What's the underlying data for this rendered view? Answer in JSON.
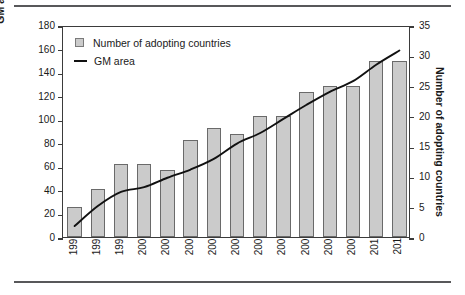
{
  "figure": {
    "has_top_rule": true,
    "has_bottom_rule": true,
    "frame_color": "#3b3b3b",
    "bar_fill": "#cbcbcb",
    "bar_stroke": "#6a6a6a",
    "line_color": "#111111"
  },
  "legend": {
    "position": "top-left-inside",
    "items": [
      {
        "marker": "square-swatch-icon",
        "label": "Number of adopting countries"
      },
      {
        "marker": "line-swatch-icon",
        "label": "GM area"
      }
    ]
  },
  "axes": {
    "left": {
      "title": "GM area (million hectares)",
      "min": 0,
      "max": 180,
      "step": 20,
      "ticks": [
        "0",
        "20",
        "40",
        "60",
        "80",
        "100",
        "120",
        "140",
        "160",
        "180"
      ]
    },
    "right": {
      "title": "Number of adopting countries",
      "min": 0,
      "max": 35,
      "step": 5,
      "ticks": [
        "0",
        "5",
        "10",
        "15",
        "20",
        "25",
        "30",
        "35"
      ]
    },
    "bottom": {
      "title": "",
      "ticks": [
        "1997",
        "1998",
        "1999",
        "2000",
        "2001",
        "2002",
        "2003",
        "2004",
        "2005",
        "2006",
        "2007",
        "2008",
        "2009",
        "2010",
        "2011"
      ]
    }
  },
  "chart_data": {
    "type": "bar",
    "title": "",
    "subtitle": "",
    "xlabel": "",
    "ylabel": "GM area (million hectares)",
    "y2label": "Number of adopting countries",
    "ylim": [
      0,
      180
    ],
    "y2lim": [
      0,
      35
    ],
    "grid": false,
    "legend_position": "upper left",
    "categories": [
      "1997",
      "1998",
      "1999",
      "2000",
      "2001",
      "2002",
      "2003",
      "2004",
      "2005",
      "2006",
      "2007",
      "2008",
      "2009",
      "2010",
      "2011"
    ],
    "series": [
      {
        "name": "Number of adopting countries",
        "type": "bar",
        "axis": "right",
        "unit": "countries",
        "values": [
          5,
          8,
          12,
          12,
          11,
          16,
          18,
          17,
          20,
          20,
          24,
          25,
          25,
          29,
          29
        ]
      },
      {
        "name": "GM area",
        "type": "line",
        "axis": "left",
        "unit": "million hectares",
        "values": [
          11,
          28,
          40,
          44,
          52,
          59,
          68,
          81,
          90,
          102,
          114,
          125,
          134,
          148,
          160
        ]
      }
    ]
  }
}
